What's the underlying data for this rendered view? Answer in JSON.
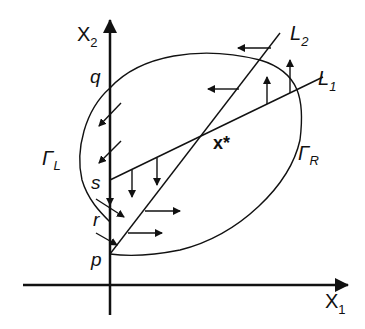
{
  "diagram": {
    "axes": {
      "x_label": "X",
      "x_sub": "1",
      "y_label": "X",
      "y_sub": "2"
    },
    "lines": [
      {
        "label": "L",
        "sub": "2"
      },
      {
        "label": "L",
        "sub": "1"
      }
    ],
    "points": {
      "q": "q",
      "s": "s",
      "r": "r",
      "p": "p",
      "xstar": "x*"
    },
    "regions": {
      "left": {
        "label": "Γ",
        "sub": "L"
      },
      "right": {
        "label": "Γ",
        "sub": "R"
      }
    },
    "colors": {
      "stroke": "#111111",
      "background": "#ffffff"
    }
  }
}
